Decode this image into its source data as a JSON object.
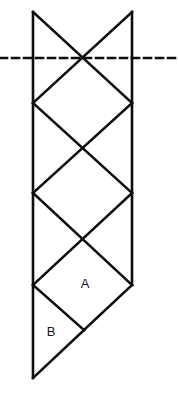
{
  "figure": {
    "background_color": "#ffffff",
    "stroke_color": "#0d0d0d",
    "stroke_width": 2.6,
    "dash_color": "#0d0d0d",
    "dash_pattern": "7,5",
    "dash_width": 2.6,
    "canvas": {
      "width": 178,
      "height": 393
    },
    "geometry": {
      "left_x": 33,
      "right_x": 132,
      "center_x": 84,
      "top_y": 12,
      "fold_y": 58,
      "node_ys": [
        12,
        58,
        103,
        148,
        193,
        239,
        285,
        330,
        378
      ],
      "bottom_y": 378,
      "right_end_y": 285
    },
    "dashed_line": {
      "name": "mirror-axis",
      "x1": 0,
      "y1": 58,
      "x2": 178,
      "y2": 58
    },
    "vertical_edges": [
      {
        "name": "left-edge",
        "x1": 33,
        "y1": 12,
        "x2": 33,
        "y2": 378
      },
      {
        "name": "right-edge",
        "x1": 132,
        "y1": 12,
        "x2": 132,
        "y2": 285
      }
    ],
    "diagonals": [
      {
        "name": "diag-1",
        "x1": 33,
        "y1": 12,
        "x2": 132,
        "y2": 103
      },
      {
        "name": "diag-2",
        "x1": 132,
        "y1": 12,
        "x2": 33,
        "y2": 103
      },
      {
        "name": "diag-3",
        "x1": 33,
        "y1": 103,
        "x2": 132,
        "y2": 193
      },
      {
        "name": "diag-4",
        "x1": 132,
        "y1": 103,
        "x2": 33,
        "y2": 193
      },
      {
        "name": "diag-5",
        "x1": 33,
        "y1": 193,
        "x2": 132,
        "y2": 285
      },
      {
        "name": "diag-6",
        "x1": 132,
        "y1": 193,
        "x2": 33,
        "y2": 285
      },
      {
        "name": "diag-7",
        "x1": 33,
        "y1": 285,
        "x2": 84,
        "y2": 330
      },
      {
        "name": "diag-8",
        "x1": 84,
        "y1": 330,
        "x2": 132,
        "y2": 285
      },
      {
        "name": "diag-9",
        "x1": 84,
        "y1": 330,
        "x2": 33,
        "y2": 378
      }
    ],
    "labels": [
      {
        "name": "region-label-a",
        "text": "A",
        "x": 85,
        "y": 285
      },
      {
        "name": "region-label-b",
        "text": "B",
        "x": 51,
        "y": 333
      }
    ]
  }
}
